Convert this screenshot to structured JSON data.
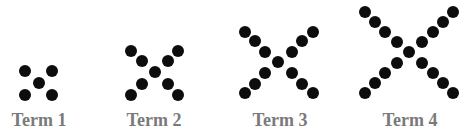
{
  "figure": {
    "dot_color": "#0d0d0d",
    "label_color": "#7a7a7a",
    "terms": [
      {
        "label": "Term 1",
        "dot_count": 5,
        "label_x": 39,
        "dots": [
          [
            25,
            71
          ],
          [
            52,
            71
          ],
          [
            39,
            83
          ],
          [
            25,
            95
          ],
          [
            52,
            95
          ]
        ]
      },
      {
        "label": "Term 2",
        "dot_count": 9,
        "label_x": 154,
        "dots": [
          [
            131,
            51
          ],
          [
            142,
            61
          ],
          [
            155,
            72
          ],
          [
            168,
            61
          ],
          [
            178,
            51
          ],
          [
            142,
            84
          ],
          [
            131,
            95
          ],
          [
            168,
            84
          ],
          [
            178,
            95
          ]
        ]
      },
      {
        "label": "Term 3",
        "dot_count": 13,
        "label_x": 280,
        "dots": [
          [
            245,
            32
          ],
          [
            255,
            41
          ],
          [
            265,
            52
          ],
          [
            278,
            62
          ],
          [
            292,
            52
          ],
          [
            302,
            41
          ],
          [
            313,
            32
          ],
          [
            265,
            73
          ],
          [
            255,
            84
          ],
          [
            245,
            93
          ],
          [
            292,
            73
          ],
          [
            302,
            84
          ],
          [
            313,
            93
          ]
        ]
      },
      {
        "label": "Term 4",
        "dot_count": 17,
        "label_x": 410,
        "dots": [
          [
            365,
            12
          ],
          [
            375,
            22
          ],
          [
            385,
            32
          ],
          [
            397,
            42
          ],
          [
            409,
            52
          ],
          [
            422,
            42
          ],
          [
            433,
            32
          ],
          [
            443,
            22
          ],
          [
            453,
            12
          ],
          [
            397,
            63
          ],
          [
            385,
            73
          ],
          [
            375,
            83
          ],
          [
            365,
            93
          ],
          [
            422,
            63
          ],
          [
            433,
            73
          ],
          [
            443,
            83
          ],
          [
            453,
            93
          ]
        ]
      }
    ]
  }
}
